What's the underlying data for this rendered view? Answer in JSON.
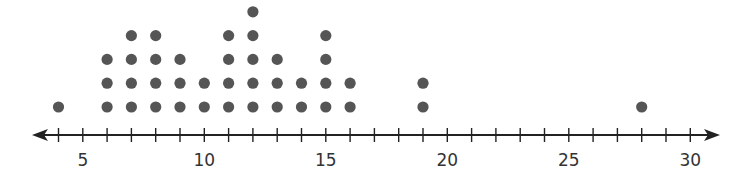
{
  "chart_data": {
    "type": "dot_plot",
    "title": "",
    "xlabel": "",
    "ylabel": "",
    "xlim": [
      3,
      31
    ],
    "axis_arrows": "both",
    "tick_step": 1,
    "tick_labels": [
      5,
      10,
      15,
      20,
      25,
      30
    ],
    "grid": false,
    "dot_color": "#555555",
    "points": [
      {
        "x": 4,
        "count": 1
      },
      {
        "x": 6,
        "count": 3
      },
      {
        "x": 7,
        "count": 4
      },
      {
        "x": 8,
        "count": 4
      },
      {
        "x": 9,
        "count": 3
      },
      {
        "x": 10,
        "count": 2
      },
      {
        "x": 11,
        "count": 4
      },
      {
        "x": 12,
        "count": 5
      },
      {
        "x": 13,
        "count": 3
      },
      {
        "x": 14,
        "count": 2
      },
      {
        "x": 15,
        "count": 4
      },
      {
        "x": 16,
        "count": 2
      },
      {
        "x": 19,
        "count": 2
      },
      {
        "x": 28,
        "count": 1
      }
    ]
  }
}
